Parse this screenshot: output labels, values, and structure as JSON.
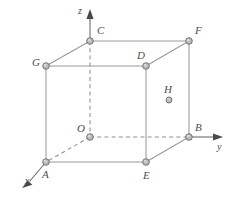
{
  "figure": {
    "caption": "",
    "background_color": "#ffffff",
    "width": 233,
    "height": 198
  },
  "style": {
    "edge_color": "#9a9a9a",
    "dashed_edge_color": "#8f8f8f",
    "axis_color": "#6e6e6e",
    "vertex_fill": "#b9b9b9",
    "vertex_stroke": "#6b6b6b",
    "label_color": "#4e4e4e"
  },
  "axes": [
    {
      "id": "x",
      "label": "x",
      "label_x": 25,
      "label_y": 176,
      "from": [
        90,
        137
      ],
      "to": [
        22,
        186
      ],
      "style": "dashed-with-arrow"
    },
    {
      "id": "y",
      "label": "y",
      "label_x": 217,
      "label_y": 142,
      "from": [
        90,
        137
      ],
      "to": [
        224,
        137
      ],
      "style": "dashed-with-arrow"
    },
    {
      "id": "z",
      "label": "z",
      "label_x": 78,
      "label_y": 6,
      "from": [
        90,
        137
      ],
      "to": [
        90,
        12
      ],
      "style": "dashed-with-arrow"
    }
  ],
  "points": [
    {
      "id": "O",
      "label": "O",
      "x": 90,
      "y": 137,
      "label_x": 77,
      "label_y": 123,
      "marker": true
    },
    {
      "id": "A",
      "label": "A",
      "x": 46,
      "y": 162,
      "label_x": 42,
      "label_y": 169,
      "marker": true
    },
    {
      "id": "B",
      "label": "B",
      "x": 189,
      "y": 137,
      "label_x": 195,
      "label_y": 122,
      "marker": true
    },
    {
      "id": "C",
      "label": "C",
      "x": 90,
      "y": 41,
      "label_x": 97,
      "label_y": 25,
      "marker": true
    },
    {
      "id": "D",
      "label": "D",
      "x": 146,
      "y": 66,
      "label_x": 137,
      "label_y": 50,
      "marker": true
    },
    {
      "id": "E",
      "label": "E",
      "x": 146,
      "y": 162,
      "label_x": 143,
      "label_y": 170,
      "marker": true
    },
    {
      "id": "F",
      "label": "F",
      "x": 189,
      "y": 41,
      "label_x": 195,
      "label_y": 25,
      "marker": true
    },
    {
      "id": "G",
      "label": "G",
      "x": 46,
      "y": 66,
      "label_x": 32,
      "label_y": 57,
      "marker": true
    },
    {
      "id": "H",
      "label": "H",
      "x": 169,
      "y": 100,
      "label_x": 164,
      "label_y": 84,
      "marker": true
    }
  ],
  "edges": [
    {
      "id": "C-F",
      "from": "C",
      "to": "F",
      "style": "solid"
    },
    {
      "id": "C-G",
      "from": "C",
      "to": "G",
      "style": "solid"
    },
    {
      "id": "G-D",
      "from": "G",
      "to": "D",
      "style": "solid"
    },
    {
      "id": "D-F",
      "from": "D",
      "to": "F",
      "style": "solid"
    },
    {
      "id": "G-A",
      "from": "G",
      "to": "A",
      "style": "solid"
    },
    {
      "id": "D-E",
      "from": "D",
      "to": "E",
      "style": "solid"
    },
    {
      "id": "F-B",
      "from": "F",
      "to": "B",
      "style": "solid"
    },
    {
      "id": "A-E",
      "from": "A",
      "to": "E",
      "style": "solid"
    },
    {
      "id": "E-B",
      "from": "E",
      "to": "B",
      "style": "solid"
    },
    {
      "id": "O-C",
      "from": "O",
      "to": "C",
      "style": "dashed"
    },
    {
      "id": "O-A",
      "from": "O",
      "to": "A",
      "style": "dashed"
    },
    {
      "id": "O-B",
      "from": "O",
      "to": "B",
      "style": "dashed"
    }
  ]
}
